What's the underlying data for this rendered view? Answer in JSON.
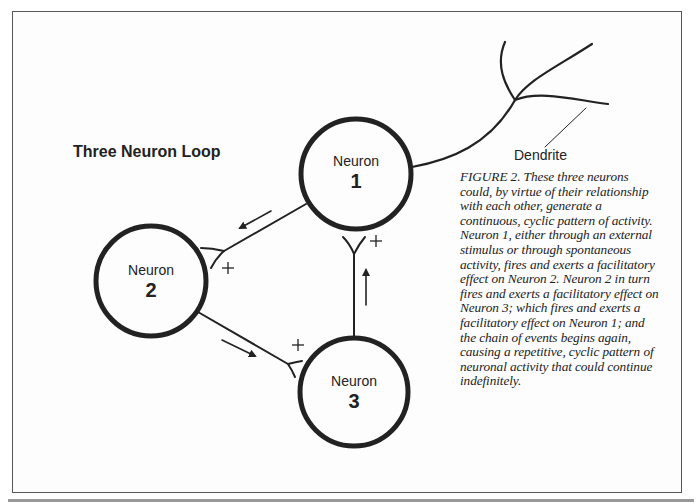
{
  "figure": {
    "title": "Three Neuron Loop",
    "dendrite_label": "Dendrite",
    "neurons": [
      {
        "name": "Neuron",
        "number": "1"
      },
      {
        "name": "Neuron",
        "number": "2"
      },
      {
        "name": "Neuron",
        "number": "3"
      }
    ],
    "synapse_sign": "+",
    "connections": [
      {
        "from": "Neuron 1",
        "to": "Neuron 2",
        "sign": "+"
      },
      {
        "from": "Neuron 2",
        "to": "Neuron 3",
        "sign": "+"
      },
      {
        "from": "Neuron 3",
        "to": "Neuron 1",
        "sign": "+"
      }
    ],
    "caption_lines": [
      "FIGURE 2. These three neurons",
      "could, by virtue of their relationship",
      "with each other, generate a",
      "continuous, cyclic pattern of activity.",
      "Neuron 1, either through an external",
      "stimulus or through spontaneous",
      "activity, fires and exerts a facilitatory",
      "effect on Neuron 2. Neuron 2 in turn",
      "fires and exerts a facilitatory effect on",
      "Neuron 3; which fires and exerts a",
      "facilitatory effect on Neuron 1; and",
      "the chain of events begins again,",
      "causing a repetitive, cyclic pattern of",
      "neuronal activity that could continue",
      "indefinitely."
    ]
  }
}
